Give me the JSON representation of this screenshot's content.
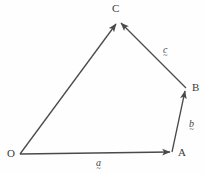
{
  "figure": {
    "background_color": "#fefefe",
    "stroke_color": "#4a4a4a",
    "text_color": "#3a3a3a",
    "width": 205,
    "height": 174
  },
  "points": [
    {
      "name": "O",
      "label": "O",
      "x": 20,
      "y": 154,
      "label_x": 7,
      "label_y": 148
    },
    {
      "name": "A",
      "label": "A",
      "x": 172,
      "y": 152,
      "label_x": 178,
      "label_y": 147
    },
    {
      "name": "B",
      "label": "B",
      "x": 186,
      "y": 88,
      "label_x": 192,
      "label_y": 82
    },
    {
      "name": "C",
      "label": "C",
      "x": 118,
      "y": 21,
      "label_x": 112,
      "label_y": 3
    }
  ],
  "vectors": [
    {
      "name": "vector-a",
      "label": "a",
      "underline": "~",
      "from": "O",
      "to": "A",
      "label_x": 96,
      "label_y": 158
    },
    {
      "name": "vector-b",
      "label": "b",
      "underline": "~",
      "from": "A",
      "to": "B",
      "label_x": 189,
      "label_y": 119
    },
    {
      "name": "vector-c",
      "label": "c",
      "underline": "~",
      "from": "B",
      "to": "C",
      "label_x": 163,
      "label_y": 45
    },
    {
      "name": "vector-resultant",
      "label": "",
      "underline": "",
      "from": "O",
      "to": "C",
      "label_x": 0,
      "label_y": 0
    }
  ]
}
